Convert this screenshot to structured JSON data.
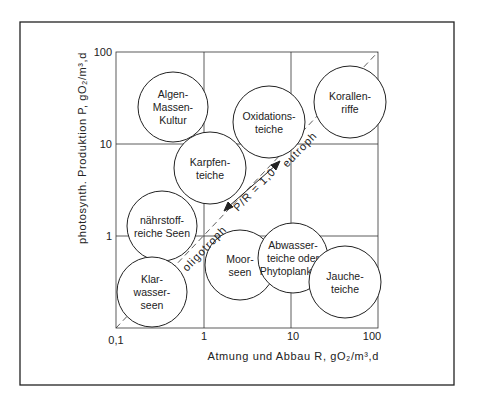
{
  "figure": {
    "frame": {
      "x": 20,
      "y": 22,
      "w": 434,
      "h": 363
    },
    "plot": {
      "x0": 116,
      "x1": 378,
      "y0": 328,
      "y1": 52
    },
    "line_color": "#222222",
    "background": "#ffffff"
  },
  "axes": {
    "x_label": "Atmung und Abbau R, gO₂/m³,d",
    "y_label": "photosynth. Produktion P, gO₂/m³,d",
    "x_ticks": [
      "0,1",
      "1",
      "10",
      "100"
    ],
    "y_ticks": [
      "100",
      "10",
      "1"
    ]
  },
  "diagonal": {
    "ratio_label": "P/R = 1,0",
    "upper_label": "eutroph",
    "lower_label": "oligotroph"
  },
  "circles": [
    {
      "id": "algen",
      "lines": [
        "Algen-",
        "Massen-",
        "Kultur"
      ],
      "cx": 173,
      "cy": 107,
      "r": 35
    },
    {
      "id": "oxidation",
      "lines": [
        "Oxidations-",
        "teiche"
      ],
      "cx": 269,
      "cy": 122,
      "r": 36
    },
    {
      "id": "korallen",
      "lines": [
        "Korallen-",
        "riffe"
      ],
      "cx": 350,
      "cy": 102,
      "r": 36
    },
    {
      "id": "karpfen",
      "lines": [
        "Karpfen-",
        "teiche"
      ],
      "cx": 210,
      "cy": 168,
      "r": 36
    },
    {
      "id": "naehrstoff",
      "lines": [
        "nährstoff-",
        "reiche Seen"
      ],
      "cx": 162,
      "cy": 226,
      "r": 35
    },
    {
      "id": "moor",
      "lines": [
        "Moor-",
        "seen"
      ],
      "cx": 240,
      "cy": 265,
      "r": 35
    },
    {
      "id": "abwasser",
      "lines": [
        "Abwasser-",
        "teiche oder",
        "Phytoplankton"
      ],
      "cx": 293,
      "cy": 258,
      "r": 35
    },
    {
      "id": "klar",
      "lines": [
        "Klar-",
        "wasser-",
        "seen"
      ],
      "cx": 152,
      "cy": 292,
      "r": 35
    },
    {
      "id": "jauche",
      "lines": [
        "Jauche-",
        "teiche"
      ],
      "cx": 345,
      "cy": 282,
      "r": 36
    }
  ],
  "chart_data": {
    "type": "scatter",
    "title": "",
    "xlabel": "Atmung und Abbau R, gO₂/m³,d",
    "ylabel": "photosynth. Produktion P, gO₂/m³,d",
    "xscale": "log",
    "yscale": "log",
    "xlim": [
      0.1,
      100
    ],
    "ylim": [
      0.1,
      100
    ],
    "x_ticks": [
      0.1,
      1,
      10,
      100
    ],
    "y_ticks": [
      1,
      10,
      100
    ],
    "grid": true,
    "reference_line": {
      "label": "P/R = 1,0",
      "from": [
        0.1,
        0.1
      ],
      "to": [
        100,
        100
      ],
      "style": "dashed",
      "above": "eutroph",
      "below": "oligotroph"
    },
    "regions": [
      {
        "name": "Algen-Massen-Kultur",
        "R": 0.45,
        "P": 25
      },
      {
        "name": "Oxidationsteiche",
        "R": 5.0,
        "P": 17
      },
      {
        "name": "Korallenriffe",
        "R": 40,
        "P": 28
      },
      {
        "name": "Karpfenteiche",
        "R": 1.2,
        "P": 5
      },
      {
        "name": "nährstoffreiche Seen",
        "R": 0.35,
        "P": 1.2
      },
      {
        "name": "Moorseen",
        "R": 2.5,
        "P": 0.45
      },
      {
        "name": "Abwasserteiche oder Phytoplankton",
        "R": 10,
        "P": 0.55
      },
      {
        "name": "Klarwasserseen",
        "R": 0.28,
        "P": 0.22
      },
      {
        "name": "Jaucheteiche",
        "R": 35,
        "P": 0.3
      }
    ]
  }
}
